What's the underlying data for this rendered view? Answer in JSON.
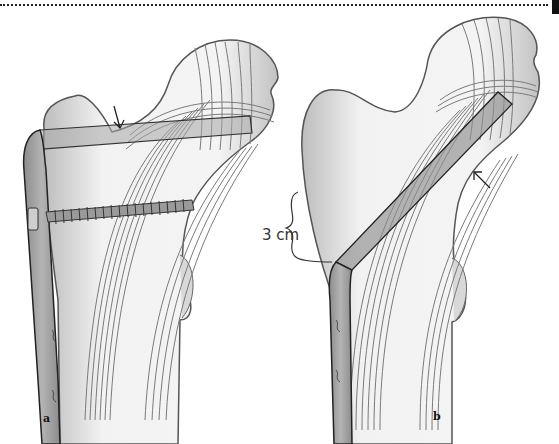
{
  "figure": {
    "panels": [
      {
        "label": "a",
        "description": "femur with plate-screw fixation, horizontal blade through femoral neck"
      },
      {
        "label": "b",
        "description": "femur with angled blade plate through femoral neck"
      }
    ],
    "annotations": {
      "measurement": "3 cm"
    },
    "colors": {
      "bone_fill": "#e4e4e4",
      "bone_outline": "#555555",
      "trabecular_lines": "#7a7a7a",
      "implant": "#8a8a8a",
      "cortex": "#909090",
      "ink": "#222222"
    }
  }
}
